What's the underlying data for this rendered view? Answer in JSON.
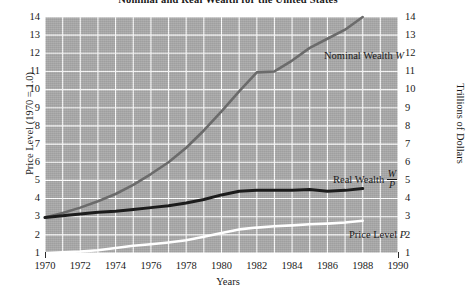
{
  "chart_data": {
    "type": "line",
    "title": "Nominal and Real Wealth for the United States",
    "xlabel": "Years",
    "ylabel_left": "Price Level (1970 = 1.0)",
    "ylabel_right": "Trillions of Dollars",
    "xlim": [
      1970,
      1990
    ],
    "ylim": [
      1,
      14
    ],
    "xticks": [
      1970,
      1972,
      1974,
      1976,
      1978,
      1980,
      1982,
      1984,
      1986,
      1988,
      1990
    ],
    "yticks": [
      1,
      2,
      3,
      4,
      5,
      6,
      7,
      8,
      9,
      10,
      11,
      12,
      13,
      14
    ],
    "grid": true,
    "grid_minor_x_step": 1,
    "grid_color": "#ffffff",
    "plot_background": "#a9a9a9",
    "legend_position": "inline-right",
    "x": [
      1970,
      1971,
      1972,
      1973,
      1974,
      1975,
      1976,
      1977,
      1978,
      1979,
      1980,
      1981,
      1982,
      1983,
      1984,
      1985,
      1986,
      1987,
      1988
    ],
    "series": [
      {
        "name": "Nominal Wealth",
        "symbol": "W",
        "color": "#6b6b6b",
        "width": 2.6,
        "values": [
          2.95,
          3.2,
          3.5,
          3.85,
          4.25,
          4.75,
          5.35,
          6.0,
          6.8,
          7.75,
          8.8,
          9.9,
          10.95,
          11.0,
          11.6,
          12.3,
          12.8,
          13.3,
          14.0
        ]
      },
      {
        "name": "Real Wealth",
        "symbol": "W/P",
        "symbol_numerator": "W",
        "symbol_denominator": "P",
        "color": "#1c1c1c",
        "width": 3.0,
        "values": [
          2.95,
          3.05,
          3.15,
          3.25,
          3.3,
          3.4,
          3.5,
          3.6,
          3.75,
          3.95,
          4.2,
          4.4,
          4.45,
          4.45,
          4.45,
          4.5,
          4.4,
          4.45,
          4.55
        ]
      },
      {
        "name": "Price Level",
        "symbol": "P",
        "color": "#ffffff",
        "width": 2.6,
        "values": [
          1.0,
          1.04,
          1.08,
          1.15,
          1.28,
          1.4,
          1.48,
          1.58,
          1.7,
          1.9,
          2.1,
          2.3,
          2.4,
          2.47,
          2.52,
          2.58,
          2.62,
          2.68,
          2.78
        ]
      }
    ],
    "annotations": [
      {
        "key": "nominal",
        "text": "Nominal Wealth",
        "symbol": "W"
      },
      {
        "key": "real",
        "text": "Real Wealth",
        "symbol_numerator": "W",
        "symbol_denominator": "P"
      },
      {
        "key": "price",
        "text": "Price Level",
        "symbol": "P"
      }
    ]
  }
}
